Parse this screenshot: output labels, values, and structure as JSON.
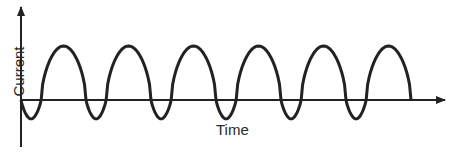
{
  "chart_data": {
    "type": "line",
    "title": "",
    "xlabel": "Time",
    "ylabel": "Current",
    "cycles": 6,
    "positive_peak_relative": 1.0,
    "negative_trough_relative": -0.35,
    "grid": false,
    "legend": null,
    "ticks": false
  },
  "axes": {
    "x_label": "Time",
    "y_label": "Current"
  },
  "style": {
    "line_color": "#222222",
    "axis_color": "#222222"
  }
}
